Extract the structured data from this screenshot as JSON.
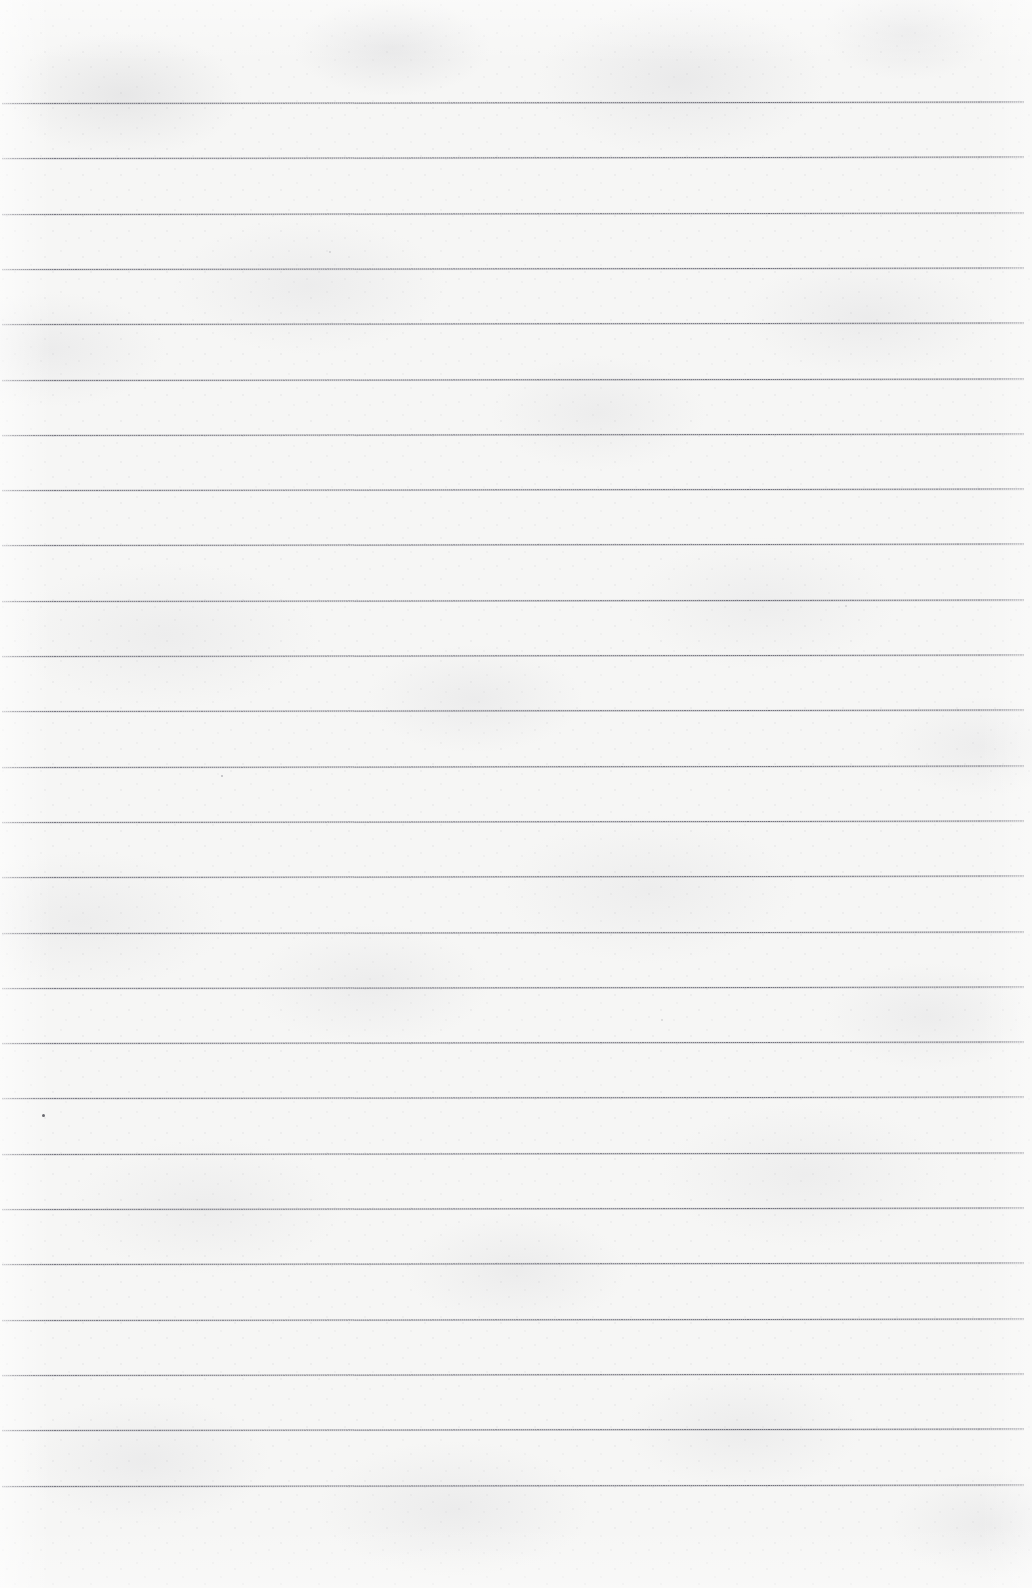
{
  "document": {
    "kind": "lined-notebook-paper",
    "title": "Blank ruled paper sheet",
    "text_content": "",
    "page_width": 1032,
    "page_height": 1588,
    "paper_color": "#f6f6f5",
    "rule_color": "#686872",
    "rule_color_soft": "#84848e"
  },
  "ruling": {
    "style": "wide-ruled horizontal lines",
    "line_count": 26,
    "first_line_y": 103,
    "line_spacing": 55.3,
    "last_line_y": 1485,
    "line_thickness": 1.3,
    "line_start_x": 2,
    "line_end_x": 1024,
    "tilt_degrees": -0.08,
    "top_margin": 103,
    "bottom_margin": 103,
    "left_margin": 2,
    "right_margin": 8,
    "has_vertical_margin_rule": false,
    "has_holes": false,
    "lines_y": [
      103,
      158.3,
      213.6,
      268.9,
      324.2,
      379.5,
      434.8,
      490.1,
      545.4,
      600.7,
      656,
      711.3,
      766.6,
      821.9,
      877.2,
      932.5,
      987.8,
      1043.1,
      1098.4,
      1153.7,
      1209,
      1264.3,
      1319.6,
      1374.9,
      1430.2,
      1485.5
    ]
  },
  "artifacts": {
    "specks": [
      {
        "x": 43,
        "y": 1115,
        "size": 3.0,
        "color": "rgba(70,70,78,0.80)"
      },
      {
        "x": 222,
        "y": 776,
        "size": 2.2,
        "color": "rgba(120,120,130,0.48)"
      },
      {
        "x": 330,
        "y": 252,
        "size": 1.8,
        "color": "rgba(150,150,158,0.34)"
      },
      {
        "x": 846,
        "y": 606,
        "size": 1.8,
        "color": "rgba(148,148,156,0.32)"
      },
      {
        "x": 662,
        "y": 1020,
        "size": 1.6,
        "color": "rgba(152,152,160,0.30)"
      }
    ]
  }
}
